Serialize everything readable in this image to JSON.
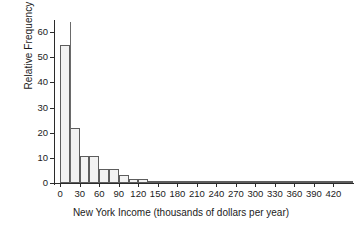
{
  "chart_data": {
    "type": "bar",
    "title": "",
    "xlabel": "New York Income (thousands of dollars per year)",
    "ylabel": "Relative Frequency",
    "xlim": [
      -8,
      450
    ],
    "ylim": [
      0,
      64
    ],
    "grid": false,
    "legend": null,
    "bin_width": 15,
    "xticks": [
      0,
      30,
      60,
      90,
      120,
      150,
      180,
      210,
      240,
      270,
      300,
      330,
      360,
      390,
      420
    ],
    "xtick_labels": [
      "0",
      "30",
      "60",
      "90",
      "120",
      "150",
      "180",
      "210",
      "240",
      "270",
      "300",
      "330",
      "360",
      "390",
      "420"
    ],
    "yticks": [
      0,
      10,
      20,
      30,
      40,
      50,
      60
    ],
    "ytick_labels": [
      "0",
      "10",
      "20",
      "30",
      "40",
      "50",
      "60"
    ],
    "bin_starts": [
      0,
      15,
      30,
      45,
      60,
      75,
      90,
      105,
      120,
      135,
      150,
      165,
      180,
      195,
      210,
      225,
      240,
      255,
      270,
      285,
      300,
      315,
      330,
      345,
      360,
      375,
      390,
      405,
      420,
      435
    ],
    "categories": [
      "0-15",
      "15-30",
      "30-45",
      "45-60",
      "60-75",
      "75-90",
      "90-105",
      "105-120",
      "120-135",
      "135-150",
      "150-165",
      "165-180",
      "180-195",
      "195-210",
      "210-225",
      "225-240",
      "240-255",
      "255-270",
      "270-285",
      "285-300",
      "300-315",
      "315-330",
      "330-345",
      "345-360",
      "360-375",
      "375-390",
      "390-405",
      "405-420",
      "420-435",
      "435-450"
    ],
    "values": [
      55,
      22,
      10.6,
      10.6,
      5.5,
      5.5,
      3.1,
      1.6,
      1.6,
      0.5,
      0.4,
      0.3,
      0.25,
      0.2,
      0.2,
      0.15,
      0.15,
      0.12,
      0.1,
      0.1,
      0.1,
      0.1,
      0.6,
      0.1,
      0.05,
      0.05,
      0.05,
      0.05,
      0.05,
      0.3
    ],
    "annotations": [
      {
        "name": "vertical-reference-line",
        "x": 15,
        "y_top": 64,
        "y_bottom": 0
      }
    ]
  }
}
